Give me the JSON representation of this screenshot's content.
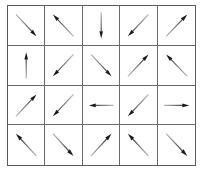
{
  "figure": {
    "kind": "quiver-grid",
    "rows": 4,
    "columns": 5,
    "background_color": "#ffffff",
    "grid_line_color": "#6a6a6a",
    "outer_border_color": "#5b5b5b",
    "arrow_color": "#1a1a1a",
    "arrow_tail_color": "#b8b8b8"
  },
  "chart_data": {
    "type": "quiver",
    "title": "",
    "xlabel": "",
    "ylabel": "",
    "grid": true,
    "legend": false,
    "rows": 4,
    "columns": 5,
    "cells": [
      {
        "row": 1,
        "col": 1,
        "direction": "down-right",
        "angle_deg": -45,
        "glyph": "↘"
      },
      {
        "row": 1,
        "col": 2,
        "direction": "up-left",
        "angle_deg": 135,
        "glyph": "↖"
      },
      {
        "row": 1,
        "col": 3,
        "direction": "down",
        "angle_deg": -90,
        "glyph": "↓"
      },
      {
        "row": 1,
        "col": 4,
        "direction": "down-left",
        "angle_deg": -135,
        "glyph": "↙"
      },
      {
        "row": 1,
        "col": 5,
        "direction": "up-right",
        "angle_deg": 45,
        "glyph": "↗"
      },
      {
        "row": 2,
        "col": 1,
        "direction": "up",
        "angle_deg": 90,
        "glyph": "↑"
      },
      {
        "row": 2,
        "col": 2,
        "direction": "down-left",
        "angle_deg": -135,
        "glyph": "↙"
      },
      {
        "row": 2,
        "col": 3,
        "direction": "down-right",
        "angle_deg": -45,
        "glyph": "↘"
      },
      {
        "row": 2,
        "col": 4,
        "direction": "up-right",
        "angle_deg": 45,
        "glyph": "↗"
      },
      {
        "row": 2,
        "col": 5,
        "direction": "up-left",
        "angle_deg": 135,
        "glyph": "↖"
      },
      {
        "row": 3,
        "col": 1,
        "direction": "up-right",
        "angle_deg": 45,
        "glyph": "↗"
      },
      {
        "row": 3,
        "col": 2,
        "direction": "down-left",
        "angle_deg": -135,
        "glyph": "↙"
      },
      {
        "row": 3,
        "col": 3,
        "direction": "left",
        "angle_deg": 180,
        "glyph": "←"
      },
      {
        "row": 3,
        "col": 4,
        "direction": "down-left",
        "angle_deg": -135,
        "glyph": "↙"
      },
      {
        "row": 3,
        "col": 5,
        "direction": "right",
        "angle_deg": 0,
        "glyph": "→"
      },
      {
        "row": 4,
        "col": 1,
        "direction": "up-left",
        "angle_deg": 135,
        "glyph": "↖"
      },
      {
        "row": 4,
        "col": 2,
        "direction": "down-right",
        "angle_deg": -45,
        "glyph": "↘"
      },
      {
        "row": 4,
        "col": 3,
        "direction": "up-right",
        "angle_deg": 45,
        "glyph": "↗"
      },
      {
        "row": 4,
        "col": 4,
        "direction": "up-left",
        "angle_deg": 135,
        "glyph": "↖"
      },
      {
        "row": 4,
        "col": 5,
        "direction": "down-right",
        "angle_deg": -45,
        "glyph": "↘"
      }
    ]
  }
}
